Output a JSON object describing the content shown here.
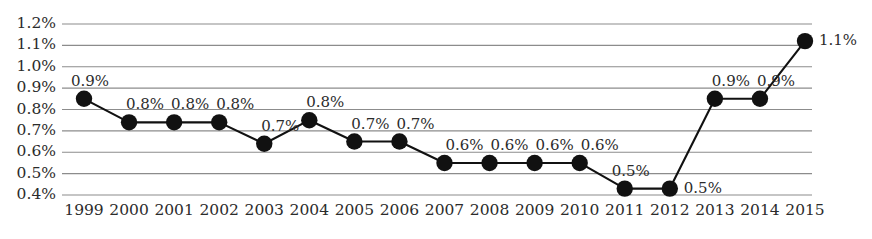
{
  "chart_data": {
    "type": "line",
    "title": "",
    "subtitle": "",
    "xlabel": "",
    "ylabel": "",
    "categories": [
      "1999",
      "2000",
      "2001",
      "2002",
      "2003",
      "2004",
      "2005",
      "2006",
      "2007",
      "2008",
      "2009",
      "2010",
      "2011",
      "2012",
      "2013",
      "2014",
      "2015"
    ],
    "values": [
      0.85,
      0.74,
      0.74,
      0.74,
      0.64,
      0.75,
      0.65,
      0.65,
      0.55,
      0.55,
      0.55,
      0.55,
      0.43,
      0.43,
      0.85,
      0.85,
      1.12
    ],
    "point_labels": [
      "0.9%",
      "0.8%",
      "0.8%",
      "0.8%",
      "0.7%",
      "0.8%",
      "0.7%",
      "0.7%",
      "0.6%",
      "0.6%",
      "0.6%",
      "0.6%",
      "0.5%",
      "0.5%",
      "0.9%",
      "0.9%",
      "1.1%"
    ],
    "ylim": [
      0.4,
      1.2
    ],
    "ytick_values": [
      1.2,
      1.1,
      1.0,
      0.9,
      0.8,
      0.7,
      0.6,
      0.5,
      0.4
    ],
    "ytick_labels": [
      "1.2%",
      "1.1%",
      "1.0%",
      "0.9%",
      "0.8%",
      "0.7%",
      "0.6%",
      "0.5%",
      "0.4%"
    ],
    "grid": "horizontal",
    "legend": "none",
    "series_color": "#111111",
    "grid_color": "#8c8c8c",
    "marker": "filled-circle"
  }
}
